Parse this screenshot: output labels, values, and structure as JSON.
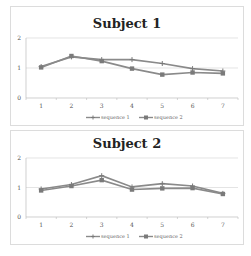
{
  "chart_data": [
    {
      "type": "line",
      "title": "Subject 1",
      "x": [
        1,
        2,
        3,
        4,
        5,
        6,
        7
      ],
      "categories": [
        "1",
        "2",
        "3",
        "4",
        "5",
        "6",
        "7"
      ],
      "series": [
        {
          "name": "sequence 1",
          "marker": "plus",
          "values": [
            1.05,
            1.37,
            1.28,
            1.28,
            1.15,
            0.98,
            0.9
          ]
        },
        {
          "name": "sequence 2",
          "marker": "square",
          "values": [
            1.02,
            1.4,
            1.23,
            0.98,
            0.78,
            0.85,
            0.82
          ]
        }
      ],
      "xlabel": "",
      "ylabel": "",
      "ylim": [
        0,
        2
      ],
      "yticks": [
        "0",
        "1",
        "2"
      ],
      "grid": true,
      "legend_position": "bottom"
    },
    {
      "type": "line",
      "title": "Subject 2",
      "x": [
        1,
        2,
        3,
        4,
        5,
        6,
        7
      ],
      "categories": [
        "1",
        "2",
        "3",
        "4",
        "5",
        "6",
        "7"
      ],
      "series": [
        {
          "name": "sequence 1",
          "marker": "plus",
          "values": [
            0.95,
            1.1,
            1.4,
            1.02,
            1.13,
            1.05,
            0.8
          ]
        },
        {
          "name": "sequence 2",
          "marker": "square",
          "values": [
            0.9,
            1.05,
            1.25,
            0.93,
            0.97,
            0.98,
            0.78
          ]
        }
      ],
      "xlabel": "",
      "ylabel": "",
      "ylim": [
        0,
        2
      ],
      "yticks": [
        "0",
        "1",
        "2"
      ],
      "grid": true,
      "legend_position": "bottom"
    }
  ],
  "colors": {
    "line": "#8a8a8a",
    "marker": "#7a7a7a",
    "grid": "#d8d8d8",
    "axis": "#bbbbbb"
  }
}
